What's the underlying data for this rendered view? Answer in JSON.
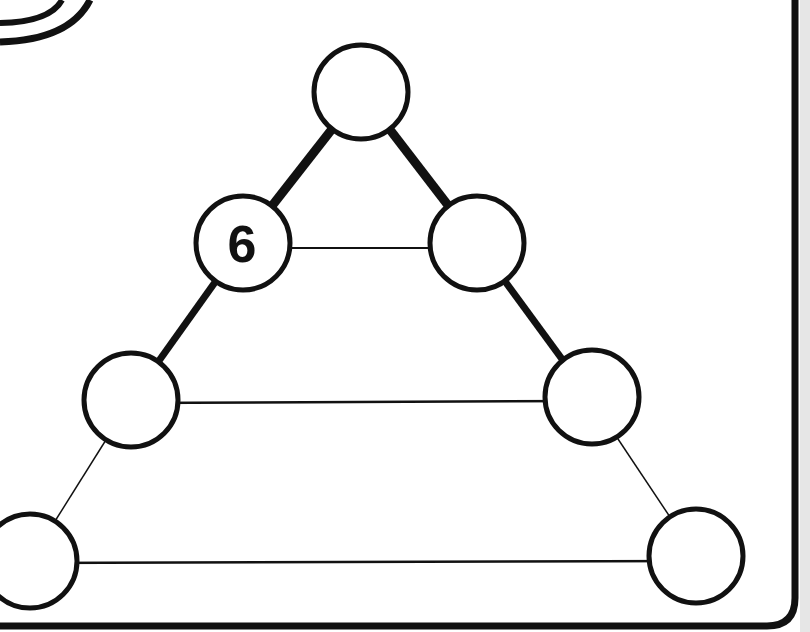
{
  "puzzle": {
    "type": "number-triangle",
    "nodes": [
      {
        "id": "top",
        "cx": 361,
        "cy": 92,
        "value": ""
      },
      {
        "id": "row2-left",
        "cx": 243,
        "cy": 243,
        "value": "6"
      },
      {
        "id": "row2-right",
        "cx": 477,
        "cy": 243,
        "value": ""
      },
      {
        "id": "row3-left",
        "cx": 131,
        "cy": 400,
        "value": ""
      },
      {
        "id": "row3-right",
        "cx": 592,
        "cy": 400,
        "value": ""
      },
      {
        "id": "bottom-left",
        "cx": 30,
        "cy": 561,
        "value": ""
      },
      {
        "id": "bottom-right",
        "cx": 696,
        "cy": 556,
        "value": ""
      }
    ],
    "node_radius": 47,
    "colors": {
      "line": "#111111",
      "background": "#ffffff",
      "side_panel": "#e6e6e6"
    }
  }
}
